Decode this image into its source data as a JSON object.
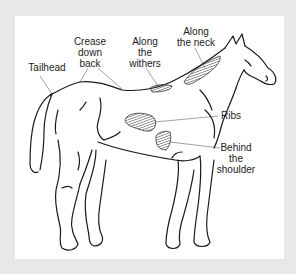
{
  "diagram": {
    "colors": {
      "frame": "#e8e8e8",
      "panel": "#ffffff",
      "outline": "#1a1a1a",
      "leader": "#8a8a8a",
      "text": "#222222"
    },
    "labels": {
      "tailhead": {
        "lines": [
          "Tailhead"
        ]
      },
      "crease": {
        "lines": [
          "Crease",
          "down",
          "back"
        ]
      },
      "withers": {
        "lines": [
          "Along",
          "the",
          "withers"
        ]
      },
      "neck": {
        "lines": [
          "Along",
          "the neck"
        ]
      },
      "ribs": {
        "lines": [
          "Ribs"
        ]
      },
      "shoulder": {
        "lines": [
          "Behind",
          "the",
          "shoulder"
        ]
      }
    }
  }
}
